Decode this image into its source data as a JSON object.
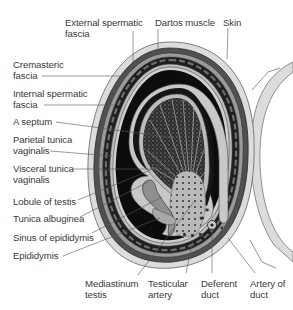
{
  "diagram": {
    "labels": [
      {
        "id": "external-spermatic-fascia",
        "text": "External spermatic\nfascia",
        "x": 65,
        "y": 17
      },
      {
        "id": "dartos-muscle",
        "text": "Dartos muscle",
        "x": 155,
        "y": 17
      },
      {
        "id": "skin",
        "text": "Skin",
        "x": 223,
        "y": 17
      },
      {
        "id": "cremasteric-fascia",
        "text": "Cremasteric\nfascia",
        "x": 13,
        "y": 59
      },
      {
        "id": "internal-spermatic-fascia",
        "text": "Internal spermatic\nfascia",
        "x": 13,
        "y": 88
      },
      {
        "id": "a-septum",
        "text": "A septum",
        "x": 13,
        "y": 116
      },
      {
        "id": "parietal-tunica-vaginalis",
        "text": "Parietal tunica\nvaginalis",
        "x": 13,
        "y": 134
      },
      {
        "id": "visceral-tunica-vaginalis",
        "text": "Visceral tunica\nvaginalis",
        "x": 13,
        "y": 163
      },
      {
        "id": "lobule-of-testis",
        "text": "Lobule of testis",
        "x": 13,
        "y": 196
      },
      {
        "id": "tunica-albuginea",
        "text": "Tunica albuginea",
        "x": 13,
        "y": 213
      },
      {
        "id": "sinus-of-epididymis",
        "text": "Sinus of epididymis",
        "x": 13,
        "y": 232
      },
      {
        "id": "epididymis",
        "text": "Epididymis",
        "x": 13,
        "y": 250
      },
      {
        "id": "mediastinum-testis",
        "text": "Mediastinum\ntestis",
        "x": 85,
        "y": 278
      },
      {
        "id": "testicular-artery",
        "text": "Testicular\nartery",
        "x": 148,
        "y": 278
      },
      {
        "id": "deferent-duct",
        "text": "Deferent\nduct",
        "x": 201,
        "y": 278
      },
      {
        "id": "artery-of-duct",
        "text": "Artery of\nduct",
        "x": 250,
        "y": 278
      }
    ],
    "leaders": [
      {
        "id": "external-spermatic-fascia",
        "points": "133,31 133,62"
      },
      {
        "id": "dartos-muscle",
        "points": "158,29 158,52"
      },
      {
        "id": "skin",
        "points": "228,28 227,59"
      },
      {
        "id": "cremasteric-fascia",
        "points": "42,76 122,76"
      },
      {
        "id": "internal-spermatic-fascia",
        "points": "44,105 113,105"
      },
      {
        "id": "a-septum",
        "points": "56,122 175,138"
      },
      {
        "id": "parietal-tunica-vaginalis",
        "points": "50,151 112,156"
      },
      {
        "id": "visceral-tunica-vaginalis",
        "points": "73,169 160,169"
      },
      {
        "id": "lobule-of-testis",
        "points": "78,200 160,166"
      },
      {
        "id": "tunica-albuginea",
        "points": "80,217 148,182"
      },
      {
        "id": "sinus-of-epididymis",
        "points": "92,233 162,197"
      },
      {
        "id": "epididymis",
        "points": "63,256 160,218"
      },
      {
        "id": "mediastinum-testis",
        "points": "138,275 194,202"
      },
      {
        "id": "testicular-artery",
        "points": "186,273 193,240"
      },
      {
        "id": "deferent-duct",
        "points": "212,273 212,228"
      },
      {
        "id": "artery-of-duct",
        "points": "255,273 228,238"
      }
    ],
    "colors": {
      "skin_fill": "#dcdcdc",
      "layer_dark": "#1a1a1a",
      "layer_mid": "#8c8c8c",
      "cavity": "#0a0a0a",
      "testis_fill": "#3b3b3b",
      "tunica": "#c8c8c8",
      "epididymis": "#9a9a9a",
      "line": "#555555",
      "text": "#3a3a3a"
    }
  }
}
